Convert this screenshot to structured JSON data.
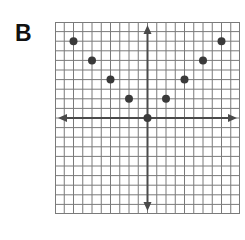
{
  "panel_label": "B",
  "chart_data": {
    "type": "scatter",
    "title": "",
    "xlabel": "",
    "ylabel": "",
    "grid": true,
    "grid_cells": [
      20,
      20
    ],
    "xlim": [
      -10,
      10
    ],
    "ylim": [
      -10,
      10
    ],
    "x": [
      -8,
      -6,
      -4,
      -2,
      0,
      2,
      4,
      6,
      8
    ],
    "y": [
      8,
      6,
      4,
      2,
      0,
      2,
      4,
      6,
      8
    ],
    "axes_arrows": true,
    "legend": null
  },
  "colors": {
    "grid": "#7a7a7a",
    "axis": "#4a4a4a",
    "point": "#3a3a3a",
    "background": "#ffffff"
  }
}
